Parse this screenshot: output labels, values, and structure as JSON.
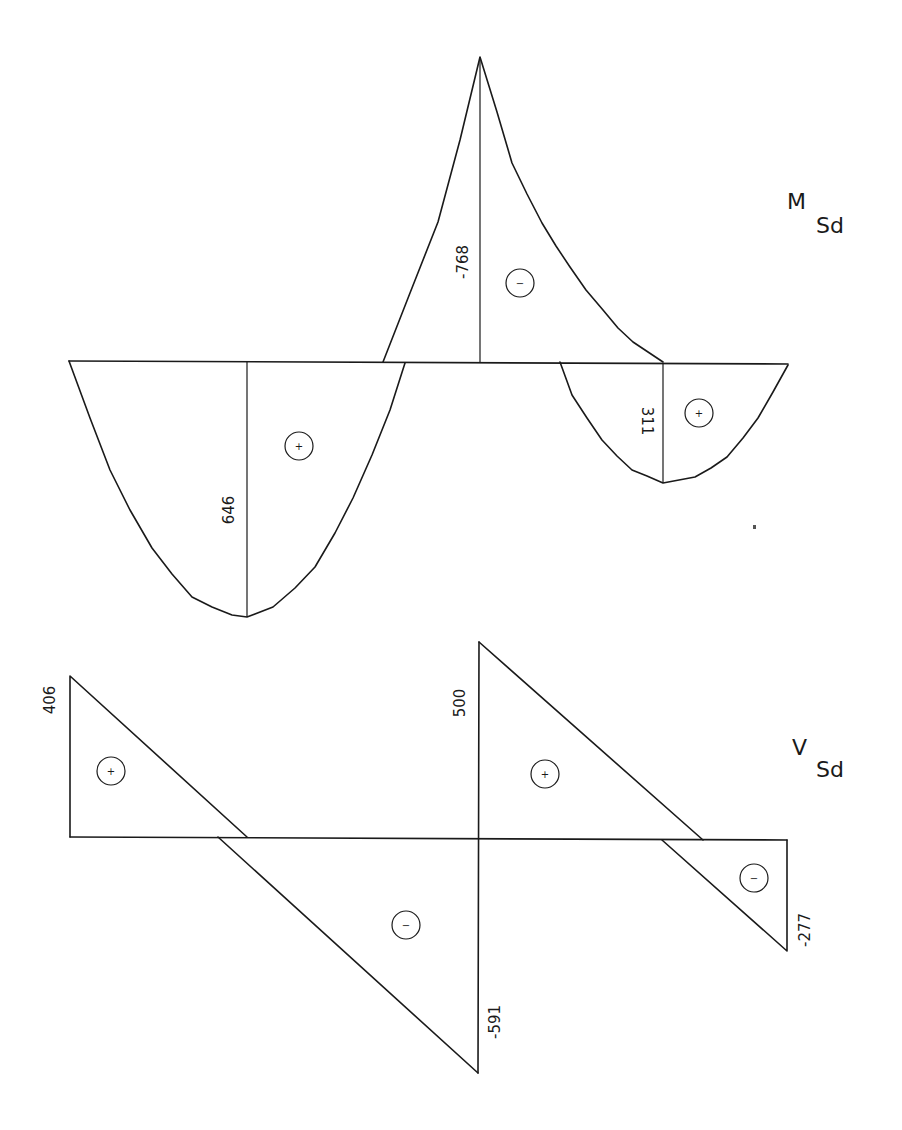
{
  "moment_diagram": {
    "title_main": "M",
    "title_sub": "Sd",
    "values": {
      "span1_max": "646",
      "support_min": "-768",
      "span2_max": "311"
    },
    "signs": {
      "span1": "+",
      "support": "−",
      "span2": "+"
    }
  },
  "shear_diagram": {
    "title_main": "V",
    "title_sub": "Sd",
    "values": {
      "left_support": "406",
      "mid_support_left": "-591",
      "mid_support_right": "500",
      "right_support": "-277"
    },
    "signs": {
      "span1_pos": "+",
      "span1_neg": "−",
      "span2_pos": "+",
      "span2_neg": "−"
    }
  }
}
